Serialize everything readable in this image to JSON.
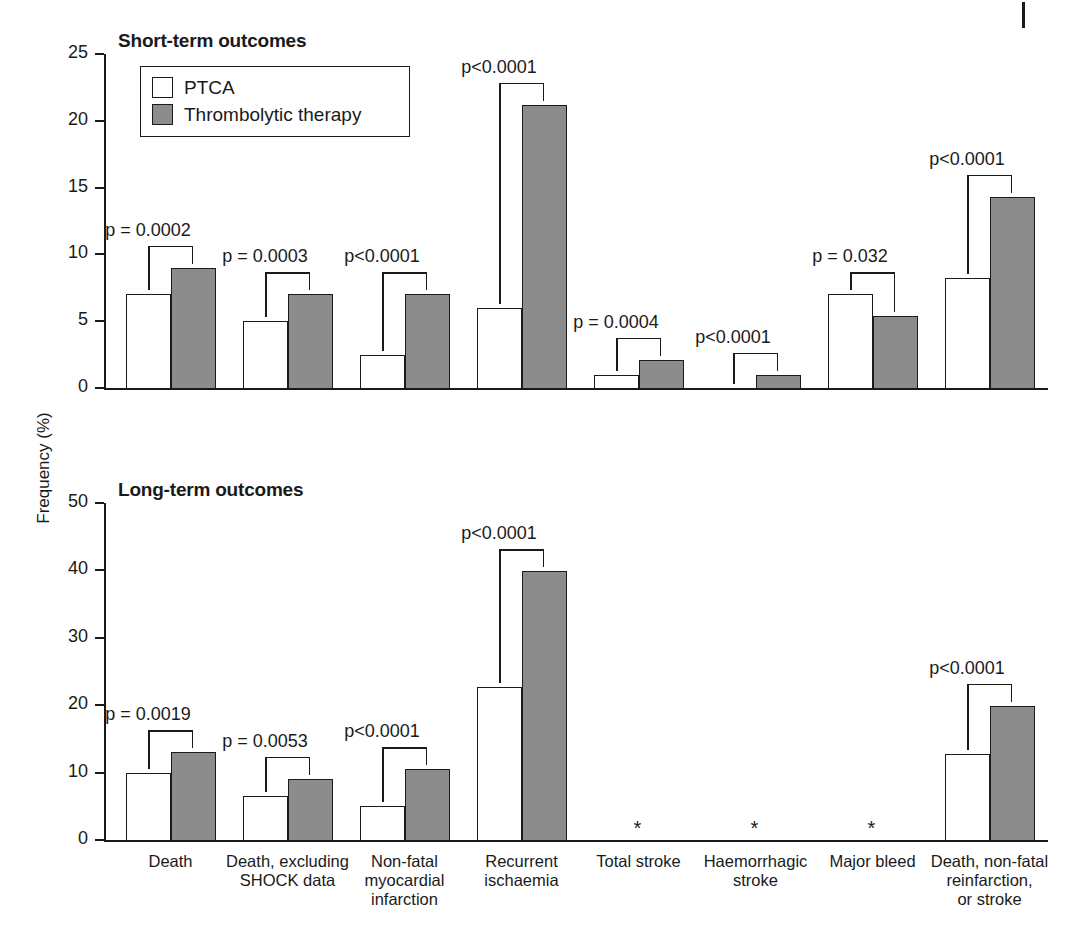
{
  "axis": {
    "ylabel": "Frequency (%)"
  },
  "legend": {
    "items": [
      {
        "label": "PTCA",
        "color": "#ffffff",
        "key": "ptca"
      },
      {
        "label": "Thrombolytic therapy",
        "color": "#8c8c8c",
        "key": "throm"
      }
    ]
  },
  "categories": [
    "Death",
    "Death, excluding\nSHOCK data",
    "Non-fatal\nmyocardial\ninfarction",
    "Recurrent\nischaemia",
    "Total stroke",
    "Haemorrhagic\nstroke",
    "Major bleed",
    "Death, non-fatal\nreinfarction,\nor stroke"
  ],
  "panels": [
    {
      "title": "Short-term outcomes",
      "yticks": [
        "0",
        "5",
        "10",
        "15",
        "20",
        "25"
      ],
      "ylim_max": 25,
      "pvalues": [
        "p = 0.0002",
        "p = 0.0003",
        "p<0.0001",
        "p<0.0001",
        "p = 0.0004",
        "p<0.0001",
        "p = 0.032",
        "p<0.0001"
      ],
      "ptca": [
        7.0,
        5.0,
        2.5,
        6.0,
        1.0,
        0.0,
        7.0,
        8.2
      ],
      "throm": [
        9.0,
        7.0,
        7.0,
        21.2,
        2.1,
        1.0,
        5.4,
        14.3
      ],
      "asterisks": []
    },
    {
      "title": "Long-term outcomes",
      "yticks": [
        "0",
        "10",
        "20",
        "30",
        "40",
        "50"
      ],
      "ylim_max": 50,
      "pvalues": [
        "p = 0.0019",
        "p = 0.0053",
        "p<0.0001",
        "p<0.0001",
        "",
        "",
        "",
        "p<0.0001"
      ],
      "ptca": [
        10.0,
        6.5,
        5.0,
        22.7,
        null,
        null,
        null,
        12.7
      ],
      "throm": [
        13.0,
        9.1,
        10.5,
        39.9,
        null,
        null,
        null,
        19.9
      ],
      "asterisks": [
        4,
        5,
        6
      ],
      "asterisk_glyph": "*"
    }
  ],
  "chart_data": {
    "type": "bar",
    "xlabel": "",
    "ylabel": "Frequency (%)",
    "grid": false,
    "legend_position": "top-left",
    "categories": [
      "Death",
      "Death, excluding SHOCK data",
      "Non-fatal myocardial infarction",
      "Recurrent ischaemia",
      "Total stroke",
      "Haemorrhagic stroke",
      "Major bleed",
      "Death, non-fatal reinfarction, or stroke"
    ],
    "panels": [
      {
        "name": "Short-term outcomes",
        "ylim": [
          0,
          25
        ],
        "yticks": [
          0,
          5,
          10,
          15,
          20,
          25
        ],
        "series": [
          {
            "name": "PTCA",
            "values": [
              7.0,
              5.0,
              2.5,
              6.0,
              1.0,
              0.0,
              7.0,
              8.2
            ]
          },
          {
            "name": "Thrombolytic therapy",
            "values": [
              9.0,
              7.0,
              7.0,
              21.2,
              2.1,
              1.0,
              5.4,
              14.3
            ]
          }
        ],
        "annotations": [
          "p = 0.0002",
          "p = 0.0003",
          "p<0.0001",
          "p<0.0001",
          "p = 0.0004",
          "p<0.0001",
          "p = 0.032",
          "p<0.0001"
        ]
      },
      {
        "name": "Long-term outcomes",
        "ylim": [
          0,
          50
        ],
        "yticks": [
          0,
          10,
          20,
          30,
          40,
          50
        ],
        "series": [
          {
            "name": "PTCA",
            "values": [
              10.0,
              6.5,
              5.0,
              22.7,
              null,
              null,
              null,
              12.7
            ]
          },
          {
            "name": "Thrombolytic therapy",
            "values": [
              13.0,
              9.1,
              10.5,
              39.9,
              null,
              null,
              null,
              19.9
            ]
          }
        ],
        "annotations": [
          "p = 0.0019",
          "p = 0.0053",
          "p<0.0001",
          "p<0.0001",
          "*",
          "*",
          "*",
          "p<0.0001"
        ],
        "note": "Asterisks mark categories with no long-term data reported"
      }
    ]
  }
}
